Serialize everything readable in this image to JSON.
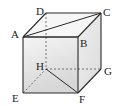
{
  "diagram": {
    "type": "cube",
    "vertices": {
      "A": {
        "label": "A",
        "x": 23,
        "y": 37
      },
      "B": {
        "label": "B",
        "x": 78,
        "y": 37
      },
      "C": {
        "label": "C",
        "x": 101,
        "y": 13
      },
      "D": {
        "label": "D",
        "x": 46,
        "y": 13
      },
      "E": {
        "label": "E",
        "x": 23,
        "y": 93
      },
      "F": {
        "label": "F",
        "x": 78,
        "y": 93
      },
      "G": {
        "label": "G",
        "x": 101,
        "y": 69
      },
      "H": {
        "label": "H",
        "x": 46,
        "y": 69
      }
    },
    "visible_edges": [
      "AB",
      "BC",
      "CD",
      "DA",
      "AE",
      "BF",
      "CG",
      "EF",
      "FG"
    ],
    "hidden_edges": [
      "DH",
      "HG",
      "EH"
    ],
    "diagonals": [
      "AC",
      "HF"
    ],
    "colors": {
      "edge": "#2a2a2a",
      "front_face_top": "#f4f4f4",
      "front_face_bottom": "#d8d8d8",
      "side_face": "#e6e6e6",
      "top_face": "#f7f7f7"
    }
  }
}
